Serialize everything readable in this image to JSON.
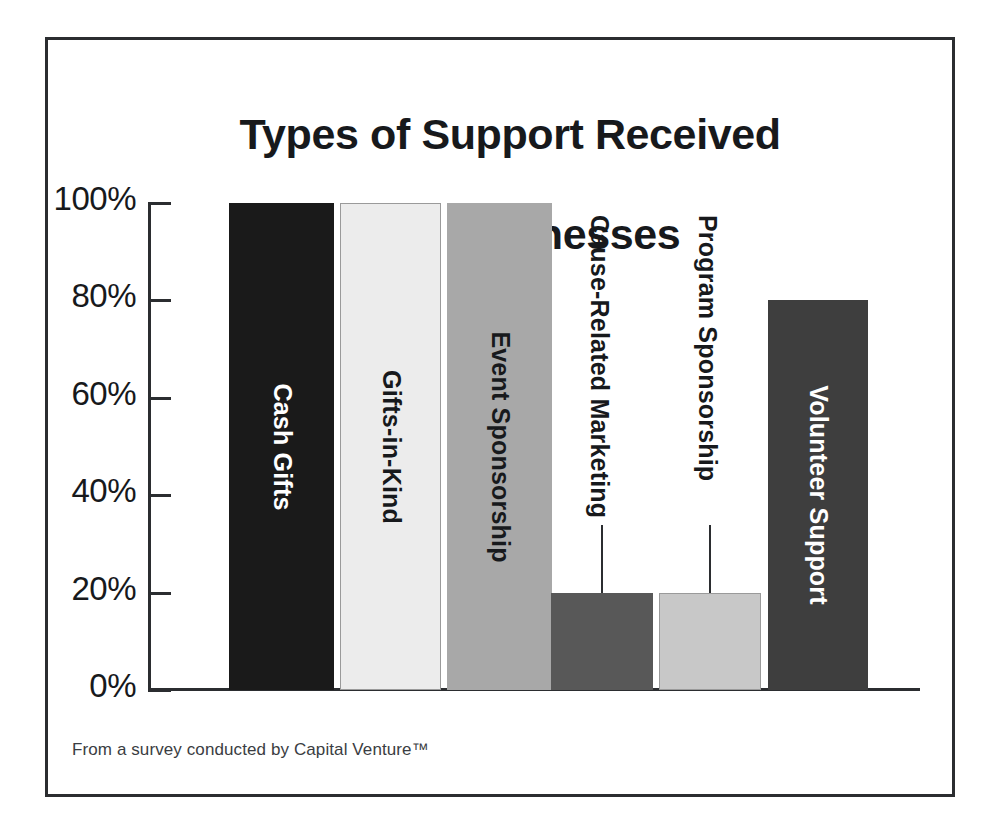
{
  "chart_data": {
    "type": "bar",
    "title": "Types of Support Received\nfrom Businesses",
    "title_line1": "Types of Support Received",
    "title_line2": "from Businesses",
    "xlabel": "",
    "ylabel": "",
    "ylim": [
      0,
      100
    ],
    "grid": false,
    "legend": "none",
    "categories": [
      "Cash Gifts",
      "Gifts-in-Kind",
      "Event Sponsorship",
      "Cause-Related Marketing",
      "Program Sponsorship",
      "Volunteer Support"
    ],
    "values": [
      100,
      100,
      100,
      20,
      20,
      80
    ],
    "value_unit": "%",
    "ytick_labels": [
      "0%",
      "20%",
      "40%",
      "60%",
      "80%",
      "100%"
    ],
    "ytick_values": [
      0,
      20,
      40,
      60,
      80,
      100
    ],
    "bar_colors": [
      "#1a1a1a",
      "#ececec",
      "#a8a8a8",
      "#585858",
      "#c8c8c8",
      "#3e3e3e"
    ],
    "bar_label_colors": [
      "#ffffff",
      "#17191c",
      "#17191c",
      "#ffffff",
      "#17191c",
      "#ffffff"
    ],
    "bar_label_placement": [
      "inside",
      "inside",
      "inside",
      "outside",
      "outside",
      "inside"
    ],
    "footnote": "From a survey conducted by Capital Venture™"
  },
  "bars": [
    {
      "label": "Cash Gifts",
      "value": 100,
      "color": "#1a1a1a",
      "text_color": "#ffffff",
      "placement": "inside"
    },
    {
      "label": "Gifts-in-Kind",
      "value": 100,
      "color": "#ececec",
      "text_color": "#17191c",
      "placement": "inside"
    },
    {
      "label": "Event Sponsorship",
      "value": 100,
      "color": "#a8a8a8",
      "text_color": "#17191c",
      "placement": "inside"
    },
    {
      "label": "Cause-Related Marketing",
      "value": 20,
      "color": "#585858",
      "text_color": "#17191c",
      "placement": "outside"
    },
    {
      "label": "Program Sponsorship",
      "value": 20,
      "color": "#c8c8c8",
      "text_color": "#17191c",
      "placement": "outside"
    },
    {
      "label": "Volunteer Support",
      "value": 80,
      "color": "#3e3e3e",
      "text_color": "#ffffff",
      "placement": "inside"
    }
  ],
  "axis": {
    "ticks": [
      {
        "label": "100%",
        "value": 100
      },
      {
        "label": "80%",
        "value": 80
      },
      {
        "label": "60%",
        "value": 60
      },
      {
        "label": "40%",
        "value": 40
      },
      {
        "label": "20%",
        "value": 20
      },
      {
        "label": "0%",
        "value": 0
      }
    ]
  },
  "footnote": {
    "text": "From a survey conducted by Capital Venture™"
  },
  "colors": {
    "frame": "#2b2d30",
    "axis": "#2b2d30",
    "text": "#17191c",
    "background": "#ffffff"
  }
}
